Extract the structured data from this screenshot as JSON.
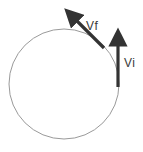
{
  "diagram": {
    "type": "circular-motion-velocity-vectors",
    "colors": {
      "background": "#ffffff",
      "circle": "#9a9a9a",
      "arrow": "#333333",
      "label": "#3a3a3a"
    },
    "circle": {
      "cx": 64,
      "cy": 84,
      "r": 55
    },
    "vectors": [
      {
        "id": "vi",
        "label": "Vi",
        "from": [
          118,
          87
        ],
        "to": [
          118,
          30
        ]
      },
      {
        "id": "vf",
        "label": "Vf",
        "from": [
          104,
          48
        ],
        "to": [
          66,
          10
        ]
      }
    ]
  }
}
